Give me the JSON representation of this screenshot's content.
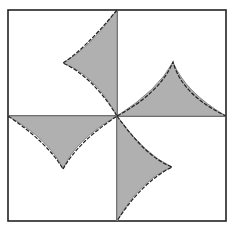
{
  "diagram": {
    "caption": "- - - - -  - -  - - - -",
    "colors": {
      "fill": "#b0b0b0",
      "outline": "#888888",
      "dashed": "#222222",
      "border": "#222222",
      "background": "#ffffff"
    },
    "shapes": [
      {
        "id": "top-left",
        "label": "Top-left concave triangle"
      },
      {
        "id": "top-right",
        "label": "Top-right concave triangle"
      },
      {
        "id": "bottom-left",
        "label": "Bottom-left concave triangle"
      },
      {
        "id": "bottom-right",
        "label": "Bottom-right concave triangle"
      }
    ]
  }
}
